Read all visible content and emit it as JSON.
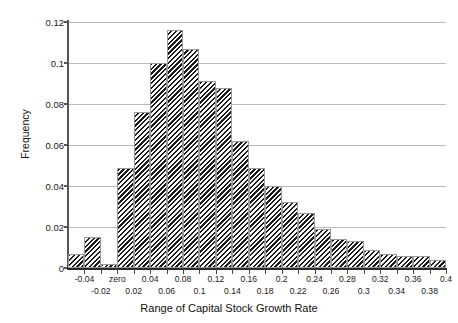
{
  "chart_data": {
    "type": "bar",
    "title": "",
    "xlabel": "Range of Capital Stock Growth Rate",
    "ylabel": "Frequency",
    "ylim": [
      0,
      0.12
    ],
    "ytick_values": [
      0,
      0.02,
      0.04,
      0.06,
      0.08,
      0.1,
      0.12
    ],
    "ytick_labels": [
      "0",
      "0.02",
      "0.04",
      "0.06",
      "0.08",
      "0.1",
      "0.12"
    ],
    "grid": true,
    "legend": "none",
    "bin_width": 0.02,
    "xtick_values": [
      -0.04,
      -0.02,
      0,
      0.02,
      0.04,
      0.06,
      0.08,
      0.1,
      0.12,
      0.14,
      0.16,
      0.18,
      0.2,
      0.22,
      0.24,
      0.26,
      0.28,
      0.3,
      0.32,
      0.34,
      0.36,
      0.38,
      0.4
    ],
    "xtick_labels": [
      "-0.04",
      "-0.02",
      "zero",
      "0.02",
      "0.04",
      "0.06",
      "0.08",
      "0.1",
      "0.12",
      "0.14",
      "0.16",
      "0.18",
      "0.2",
      "0.22",
      "0.24",
      "0.26",
      "0.28",
      "0.3",
      "0.32",
      "0.34",
      "0.36",
      "0.38",
      "0.4"
    ],
    "xlim": [
      -0.06,
      0.4
    ],
    "categories": [
      "-0.06",
      "-0.04",
      "-0.02",
      "zero",
      "0.02",
      "0.04",
      "0.06",
      "0.08",
      "0.1",
      "0.12",
      "0.14",
      "0.16",
      "0.18",
      "0.2",
      "0.22",
      "0.24",
      "0.26",
      "0.28",
      "0.3",
      "0.32",
      "0.34",
      "0.36",
      "0.38"
    ],
    "bin_starts": [
      -0.06,
      -0.04,
      -0.02,
      0.0,
      0.02,
      0.04,
      0.06,
      0.08,
      0.1,
      0.12,
      0.14,
      0.16,
      0.18,
      0.2,
      0.22,
      0.24,
      0.26,
      0.28,
      0.3,
      0.32,
      0.34,
      0.36,
      0.38
    ],
    "values": [
      0.007,
      0.015,
      0.002,
      0.049,
      0.076,
      0.1,
      0.116,
      0.107,
      0.091,
      0.088,
      0.062,
      0.049,
      0.04,
      0.032,
      0.027,
      0.019,
      0.014,
      0.013,
      0.009,
      0.007,
      0.006,
      0.006,
      0.004
    ]
  },
  "axes": {
    "ylabel": "Frequency",
    "xlabel": "Range of Capital Stock Growth Rate"
  }
}
